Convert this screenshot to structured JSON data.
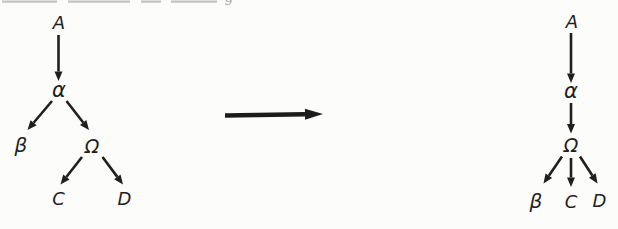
{
  "figure": {
    "canvas": {
      "width": 618,
      "height": 229,
      "background": "#fcfcfb",
      "ink": "#1f1f1f"
    },
    "edge_style": {
      "width": 2.6,
      "head_len": 9.5,
      "head_w": 8,
      "color": "#1f1f1f"
    },
    "main_arrow_style": {
      "width": 4.6,
      "head_len": 18,
      "head_w": 11,
      "color": "#1c1c1c"
    },
    "trees": [
      {
        "name": "left-tree",
        "nodes": [
          {
            "id": "A",
            "label": "A",
            "x": 59,
            "y": 28.5,
            "size": 18
          },
          {
            "id": "alpha",
            "label": "α",
            "x": 59,
            "y": 97,
            "size": 21
          },
          {
            "id": "beta",
            "label": "β",
            "x": 21,
            "y": 152,
            "size": 20
          },
          {
            "id": "omega",
            "label": "Ω",
            "x": 92,
            "y": 152.5,
            "size": 19
          },
          {
            "id": "C",
            "label": "C",
            "x": 58.5,
            "y": 205,
            "size": 18
          },
          {
            "id": "D",
            "label": "D",
            "x": 124.5,
            "y": 205,
            "size": 18
          }
        ],
        "edges": [
          {
            "name": "edge-A-alpha",
            "from": [
              58.5,
              35
            ],
            "to": [
              58.5,
              81
            ]
          },
          {
            "name": "edge-alpha-beta",
            "from": [
              52,
              101
            ],
            "to": [
              27.5,
              130
            ]
          },
          {
            "name": "edge-alpha-omega",
            "from": [
              66.5,
              101
            ],
            "to": [
              89,
              130
            ]
          },
          {
            "name": "edge-omega-C",
            "from": [
              82,
              157
            ],
            "to": [
              60.5,
              184.5
            ]
          },
          {
            "name": "edge-omega-D",
            "from": [
              102.5,
              157
            ],
            "to": [
              123,
              184.5
            ]
          }
        ]
      },
      {
        "name": "right-tree",
        "nodes": [
          {
            "id": "A",
            "label": "A",
            "x": 572,
            "y": 27.5,
            "size": 18
          },
          {
            "id": "alpha",
            "label": "α",
            "x": 571,
            "y": 98,
            "size": 21
          },
          {
            "id": "omega",
            "label": "Ω",
            "x": 571,
            "y": 152,
            "size": 19
          },
          {
            "id": "beta",
            "label": "β",
            "x": 536,
            "y": 207.5,
            "size": 20
          },
          {
            "id": "C",
            "label": "C",
            "x": 571,
            "y": 208,
            "size": 18
          },
          {
            "id": "D",
            "label": "D",
            "x": 599.5,
            "y": 206.5,
            "size": 18
          }
        ],
        "edges": [
          {
            "name": "edge-A-alpha",
            "from": [
              571,
              33
            ],
            "to": [
              571,
              83
            ]
          },
          {
            "name": "edge-alpha-omega",
            "from": [
              571,
              103
            ],
            "to": [
              571,
              133.5
            ]
          },
          {
            "name": "edge-omega-beta",
            "from": [
              562,
              156.5
            ],
            "to": [
              543.5,
              183.5
            ]
          },
          {
            "name": "edge-omega-C",
            "from": [
              571,
              158
            ],
            "to": [
              571,
              187
            ]
          },
          {
            "name": "edge-omega-D",
            "from": [
              580,
              156.5
            ],
            "to": [
              597.5,
              183.5
            ]
          }
        ]
      }
    ],
    "transform_arrow": {
      "name": "transforms-to-arrow",
      "from": [
        225,
        115.5
      ],
      "to": [
        323,
        114
      ]
    },
    "top_artifact": {
      "color": "#c2c2c2",
      "segments": [
        [
          2,
          57
        ],
        [
          68,
          130
        ],
        [
          141,
          161
        ],
        [
          171,
          217
        ]
      ],
      "glyph": "g",
      "glyph_color": "#a8a8a8",
      "glyph_x": 229,
      "glyph_baseline": 1.5,
      "glyph_size": 13
    }
  }
}
